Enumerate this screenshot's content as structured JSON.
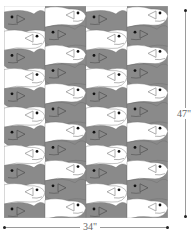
{
  "diagram": {
    "columns": 4,
    "rows_per_column": 11,
    "colors": {
      "gray_fish": "#8a8a8a",
      "white_fish": "#ffffff",
      "outline": "#6a6a6a",
      "eye": "#111111"
    },
    "column_start": [
      "gray",
      "white",
      "gray",
      "white"
    ]
  },
  "dimensions": {
    "height_label": "47\"",
    "width_label": "34\""
  }
}
